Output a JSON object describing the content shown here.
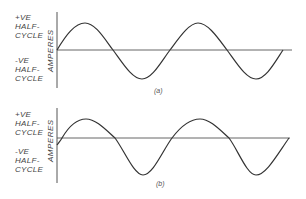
{
  "panels": [
    {
      "id": "a",
      "caption": "(a)",
      "positive_label": [
        "+VE",
        "HALF-",
        "CYCLE"
      ],
      "negative_label": [
        "-VE",
        "HALF-",
        "CYCLE"
      ],
      "axis_label": "AMPERES",
      "waveform": "sine, 2.5 cycles, starts at zero going positive"
    },
    {
      "id": "b",
      "caption": "(b)",
      "positive_label": [
        "+VE",
        "HALF-",
        "CYCLE"
      ],
      "negative_label": [
        "-VE",
        "HALF-",
        "CYCLE"
      ],
      "axis_label": "AMPERES",
      "waveform": "sine, ~2.5 cycles, starts slightly negative (phase-lagged)"
    }
  ],
  "colors": {
    "line": "#333333",
    "axis": "#555555"
  }
}
